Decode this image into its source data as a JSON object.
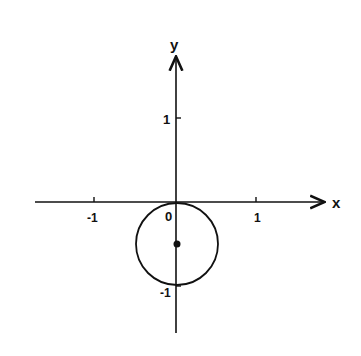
{
  "diagram": {
    "type": "coordinate-plane-circle",
    "axes": {
      "x_label": "x",
      "y_label": "y",
      "x_ticks": [
        {
          "value": -1,
          "label": "-1"
        },
        {
          "value": 1,
          "label": "1"
        }
      ],
      "y_ticks": [
        {
          "value": 1,
          "label": "1"
        },
        {
          "value": -1,
          "label": "-1"
        }
      ],
      "origin_label": "0"
    },
    "circle": {
      "center": [
        0,
        -0.5
      ],
      "radius": 0.5,
      "center_marked": true
    },
    "colors": {
      "stroke": "#111111",
      "background": "#ffffff"
    }
  }
}
